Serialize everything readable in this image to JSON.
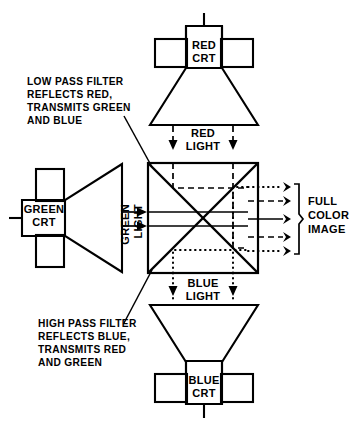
{
  "diagram": {
    "ink_color": "#000000",
    "background_color": "#ffffff",
    "sources": {
      "red_crt": {
        "label_line1": "RED",
        "label_line2": "CRT",
        "position": "top",
        "emits": "RED LIGHT"
      },
      "green_crt": {
        "label_line1": "GREEN",
        "label_line2": "CRT",
        "position": "left",
        "emits": "GREEN LIGHT"
      },
      "blue_crt": {
        "label_line1": "BLUE",
        "label_line2": "CRT",
        "position": "bottom",
        "emits": "BLUE LIGHT"
      }
    },
    "beam_labels": {
      "red": {
        "line1": "RED",
        "line2": "LIGHT",
        "style": "dashed"
      },
      "green": {
        "line1": "GREEN",
        "line2": "LIGHT",
        "style": "solid"
      },
      "blue": {
        "line1": "BLUE",
        "line2": "LIGHT",
        "style": "dotted"
      }
    },
    "output": {
      "line1": "FULL",
      "line2": "COLOR",
      "line3": "IMAGE",
      "ray_count": 5,
      "ray_styles": [
        "dotted",
        "dashed",
        "solid",
        "dashed",
        "dotted"
      ]
    },
    "annotations": {
      "low_pass": {
        "line1": "LOW PASS FILTER",
        "line2": "REFLECTS RED,",
        "line3": "TRANSMITS GREEN",
        "line4": "AND BLUE"
      },
      "high_pass": {
        "line1": "HIGH PASS FILTER",
        "line2": "REFLECTS BLUE,",
        "line3": "TRANSMITS RED",
        "line4": "AND GREEN"
      }
    }
  }
}
